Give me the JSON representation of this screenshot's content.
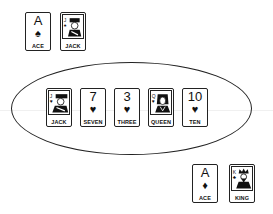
{
  "player_hand": {
    "cards": [
      {
        "rank": "A",
        "suit": "spade",
        "suit_glyph": "♠",
        "name": "ACE",
        "face": false
      },
      {
        "rank": "J",
        "suit": "spade",
        "suit_glyph": "♠",
        "name": "JACK",
        "face": true
      }
    ]
  },
  "table": {
    "cards": [
      {
        "rank": "J",
        "suit": "heart",
        "suit_glyph": "♥",
        "name": "JACK",
        "face": true
      },
      {
        "rank": "7",
        "suit": "heart",
        "suit_glyph": "♥",
        "name": "SEVEN",
        "face": false
      },
      {
        "rank": "3",
        "suit": "heart",
        "suit_glyph": "♥",
        "name": "THREE",
        "face": false
      },
      {
        "rank": "Q",
        "suit": "heart",
        "suit_glyph": "♥",
        "name": "QUEEN",
        "face": true
      },
      {
        "rank": "10",
        "suit": "heart",
        "suit_glyph": "♥",
        "name": "TEN",
        "face": false
      }
    ]
  },
  "opponent_hand": {
    "cards": [
      {
        "rank": "A",
        "suit": "diamond",
        "suit_glyph": "♦",
        "name": "ACE",
        "face": false
      },
      {
        "rank": "K",
        "suit": "club",
        "suit_glyph": "♣",
        "name": "KING",
        "face": true
      }
    ]
  }
}
